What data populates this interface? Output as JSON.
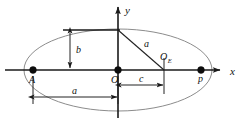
{
  "figure": {
    "name": "ellipse-geometry-diagram",
    "background_color": "#ffffff",
    "ink_color": "#1a1a1a",
    "ellipse_color": "#8c8c8c"
  },
  "axes": {
    "x_label": "x",
    "y_label": "y",
    "origin_label": "O"
  },
  "points": [
    {
      "id": "A",
      "label": "A",
      "x": 33,
      "y": 70
    },
    {
      "id": "O",
      "label": "O",
      "x": 118,
      "y": 70
    },
    {
      "id": "P",
      "label": "p",
      "x": 201,
      "y": 70
    }
  ],
  "focus": {
    "label_main": "O",
    "label_sub": "E",
    "x": 164,
    "y": 70
  },
  "dimensions": [
    {
      "id": "semi-minor",
      "label": "b",
      "orientation": "vertical",
      "from": 32,
      "to": 68,
      "at": 70
    },
    {
      "id": "center-offset",
      "label": "c",
      "orientation": "horizontal",
      "from": 120,
      "to": 163,
      "at": 85
    },
    {
      "id": "semi-major",
      "label": "a",
      "orientation": "horizontal",
      "from": 33,
      "to": 117,
      "at": 97
    },
    {
      "id": "hypotenuse",
      "label": "a",
      "orientation": "diagonal",
      "from_x": 118,
      "from_y": 30,
      "to_x": 164,
      "to_y": 70
    }
  ],
  "ellipse": {
    "center_x": 118,
    "center_y": 70,
    "semi_major_px": 94,
    "semi_minor_px": 41
  }
}
